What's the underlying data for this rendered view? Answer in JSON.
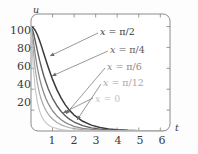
{
  "chart_data": {
    "type": "line",
    "title": "",
    "xlabel": "t",
    "ylabel": "u",
    "xlim": [
      0,
      6.45
    ],
    "ylim": [
      0,
      112
    ],
    "xticks": [
      1,
      2,
      3,
      4,
      5,
      6
    ],
    "yticks": [
      20,
      40,
      60,
      80,
      100
    ],
    "grid": false,
    "legend_position": "inline-annotations",
    "x": [
      0,
      0.1,
      0.2,
      0.3,
      0.4,
      0.5,
      0.6,
      0.7,
      0.8,
      0.9,
      1.0,
      1.2,
      1.4,
      1.6,
      1.8,
      2.0,
      2.4,
      2.8,
      3.2,
      3.6,
      4.0,
      4.5,
      5.0,
      5.5,
      6.0,
      6.4
    ],
    "series": [
      {
        "name": "x = π/2",
        "label": "x = π/2",
        "color": "#3a3a3a",
        "width": 1.5,
        "values": [
          100,
          99.0,
          96.2,
          91.9,
          86.4,
          80.3,
          73.8,
          67.3,
          61.0,
          55.0,
          49.4,
          39.6,
          31.4,
          24.8,
          19.5,
          15.3,
          9.3,
          5.6,
          3.4,
          2.0,
          1.2,
          0.6,
          0.3,
          0.15,
          0.08,
          0.05
        ]
      },
      {
        "name": "x = π/4",
        "label": "x = π/4",
        "color": "#5e5e5e",
        "width": 1.4,
        "values": [
          100,
          95.0,
          86.0,
          76.5,
          67.6,
          59.6,
          52.4,
          46.1,
          40.5,
          35.6,
          31.3,
          24.2,
          18.7,
          14.4,
          11.1,
          8.6,
          5.1,
          3.0,
          1.8,
          1.05,
          0.62,
          0.31,
          0.16,
          0.08,
          0.04,
          0.03
        ]
      },
      {
        "name": "x = π/6",
        "label": "x = π/6",
        "color": "#8a8a8a",
        "width": 1.3,
        "values": [
          100,
          88.0,
          72.5,
          60.0,
          50.2,
          42.4,
          36.0,
          30.7,
          26.3,
          22.6,
          19.4,
          14.4,
          10.7,
          8.0,
          6.0,
          4.5,
          2.6,
          1.5,
          0.87,
          0.5,
          0.29,
          0.14,
          0.07,
          0.035,
          0.018,
          0.012
        ]
      },
      {
        "name": "x = π/12",
        "label": "x = π/12",
        "color": "#a8a8a8",
        "width": 1.2,
        "values": [
          100,
          78.0,
          58.5,
          45.0,
          35.6,
          28.7,
          23.5,
          19.4,
          16.2,
          13.6,
          11.5,
          8.2,
          5.9,
          4.3,
          3.1,
          2.3,
          1.25,
          0.7,
          0.39,
          0.22,
          0.12,
          0.055,
          0.026,
          0.012,
          0.006,
          0.004
        ]
      },
      {
        "name": "x = 0",
        "label": "x = 0",
        "color": "#c4c4c4",
        "width": 1.1,
        "values": [
          100,
          62.0,
          40.0,
          27.0,
          19.0,
          13.8,
          10.2,
          7.7,
          5.9,
          4.6,
          3.6,
          2.3,
          1.5,
          1.0,
          0.66,
          0.44,
          0.2,
          0.09,
          0.042,
          0.02,
          0.009,
          0.0035,
          0.0014,
          0.0006,
          0.0002,
          0.0001
        ]
      }
    ],
    "annotations": [
      {
        "text": "x = π/2",
        "label_x": 100,
        "label_y": 27,
        "arrow_from_x": 98,
        "arrow_from_y": 33,
        "arrow_to_x": 50,
        "arrow_to_y": 56
      },
      {
        "text": "x = π/4",
        "label_x": 110,
        "label_y": 45,
        "arrow_from_x": 108,
        "arrow_from_y": 51,
        "arrow_to_x": 52,
        "arrow_to_y": 76
      },
      {
        "text": "x = π/6",
        "label_x": 107,
        "label_y": 62,
        "arrow_from_x": 105,
        "arrow_from_y": 68,
        "arrow_to_x": 66,
        "arrow_to_y": 114
      },
      {
        "text": "x = π/12",
        "label_x": 103,
        "label_y": 78,
        "arrow_from_x": 101,
        "arrow_from_y": 84,
        "arrow_to_x": 77,
        "arrow_to_y": 120
      },
      {
        "text": "x = 0",
        "label_x": 95,
        "label_y": 94,
        "arrow_from_x": 93,
        "arrow_from_y": 98,
        "arrow_to_x": 63,
        "arrow_to_y": 113
      }
    ]
  },
  "axes": {
    "y_axis_name": "u",
    "x_axis_name": "t",
    "y_tick_labels": [
      "100",
      "80",
      "60",
      "40",
      "20"
    ],
    "x_tick_labels": [
      "1",
      "2",
      "3",
      "4",
      "5",
      "6"
    ]
  },
  "style": {
    "frame_color": "#808080",
    "text_color": "#3b3b3b",
    "background": "#fdfdfd",
    "arrow_color": "#6b6b6b"
  }
}
